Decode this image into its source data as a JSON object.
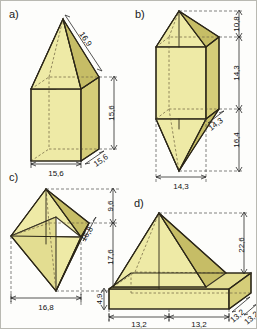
{
  "page": {
    "background_color": "#fdfdfb",
    "border_color": "#b9b9b2",
    "solid_fill_color": "#eeeaa6",
    "edge_color": "#2b2617",
    "hidden_edge_color": "#7a6f4a",
    "dimension_line_color": "#2a2a2a"
  },
  "figures": [
    {
      "letter": "a)",
      "shape": "square prism with pyramid roof (house solid)",
      "dimensions": [
        {
          "id": "a-slant",
          "value": "16,9",
          "orientation": "diagonal",
          "placement": "roof-slant-top-right"
        },
        {
          "id": "a-height",
          "value": "15,6",
          "orientation": "vertical",
          "placement": "right-side"
        },
        {
          "id": "a-depth",
          "value": "15,6",
          "orientation": "diagonal",
          "placement": "bottom-right-depth"
        },
        {
          "id": "a-width",
          "value": "15,6",
          "orientation": "horizontal",
          "placement": "bottom"
        }
      ]
    },
    {
      "letter": "b)",
      "shape": "square prism with pyramids on top and bottom",
      "dimensions": [
        {
          "id": "b-top",
          "value": "10,8",
          "orientation": "vertical",
          "placement": "right-top"
        },
        {
          "id": "b-middle",
          "value": "14,3",
          "orientation": "vertical",
          "placement": "right-middle"
        },
        {
          "id": "b-depth",
          "value": "14,3",
          "orientation": "diagonal",
          "placement": "right-depth"
        },
        {
          "id": "b-bottom",
          "value": "16,4",
          "orientation": "vertical",
          "placement": "right-bottom"
        },
        {
          "id": "b-width",
          "value": "14,3",
          "orientation": "horizontal",
          "placement": "bottom"
        }
      ]
    },
    {
      "letter": "c)",
      "shape": "octahedron (two square pyramids joined at base)",
      "dimensions": [
        {
          "id": "c-top",
          "value": "9,6",
          "orientation": "vertical",
          "placement": "right-top"
        },
        {
          "id": "c-depth",
          "value": "16,8",
          "orientation": "diagonal",
          "placement": "right-depth"
        },
        {
          "id": "c-bottom",
          "value": "17,6",
          "orientation": "vertical",
          "placement": "right-lower"
        },
        {
          "id": "c-width",
          "value": "16,8",
          "orientation": "horizontal",
          "placement": "bottom"
        }
      ]
    },
    {
      "letter": "d)",
      "shape": "square pyramid on rectangular slab base",
      "dimensions": [
        {
          "id": "d-height",
          "value": "22,6",
          "orientation": "vertical",
          "placement": "right-side"
        },
        {
          "id": "d-slab",
          "value": "4,9",
          "orientation": "vertical",
          "placement": "left-slab-thickness"
        },
        {
          "id": "d-width-1",
          "value": "13,2",
          "orientation": "horizontal",
          "placement": "bottom-left"
        },
        {
          "id": "d-width-2",
          "value": "13,2",
          "orientation": "horizontal",
          "placement": "bottom-right"
        },
        {
          "id": "d-depth-1",
          "value": "13,2",
          "orientation": "diagonal",
          "placement": "bottom-right-depth-inner"
        },
        {
          "id": "d-depth-2",
          "value": "13,2",
          "orientation": "diagonal",
          "placement": "bottom-right-depth-outer"
        }
      ]
    }
  ]
}
